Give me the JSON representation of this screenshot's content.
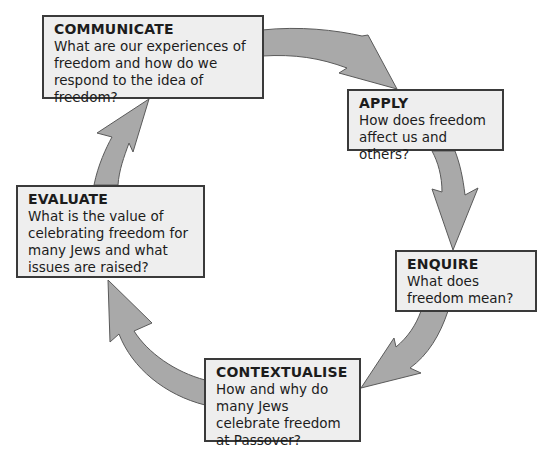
{
  "diagram": {
    "type": "cycle",
    "colors": {
      "arrow_fill": "#a9a9a9",
      "arrow_stroke": "#5a5a5a",
      "box_fill": "#eeeeee",
      "box_border": "#3a3a3a"
    },
    "stages": [
      {
        "id": "communicate",
        "title": "COMMUNICATE",
        "question": "What are our experiences of freedom and how do we respond to the idea of freedom?"
      },
      {
        "id": "apply",
        "title": "APPLY",
        "question": "How does freedom affect us and others?"
      },
      {
        "id": "enquire",
        "title": "ENQUIRE",
        "question": "What does freedom mean?"
      },
      {
        "id": "contextualise",
        "title": "CONTEXTUALISE",
        "question": "How and why do many Jews celebrate freedom at Passover?"
      },
      {
        "id": "evaluate",
        "title": "EVALUATE",
        "question": "What is the value of celebrating freedom for many Jews and what issues are raised?"
      }
    ],
    "flow": [
      {
        "from": "communicate",
        "to": "apply"
      },
      {
        "from": "apply",
        "to": "enquire"
      },
      {
        "from": "enquire",
        "to": "contextualise"
      },
      {
        "from": "contextualise",
        "to": "evaluate"
      },
      {
        "from": "evaluate",
        "to": "communicate"
      }
    ]
  }
}
